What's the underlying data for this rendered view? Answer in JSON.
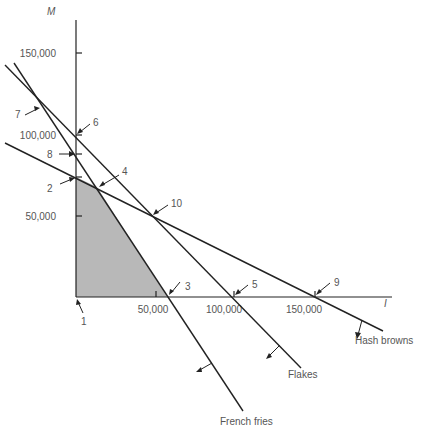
{
  "diagram": {
    "axes": {
      "y_label": "M",
      "x_label": "I",
      "y_ticks": [
        "150,000",
        "100,000",
        "50,000"
      ],
      "x_ticks": [
        "50,000",
        "100,000",
        "150,000"
      ]
    },
    "constraints": [
      {
        "name": "French fries",
        "label": "French fries"
      },
      {
        "name": "Flakes",
        "label": "Flakes"
      },
      {
        "name": "Hash browns",
        "label": "Hash browns"
      }
    ],
    "points": [
      "1",
      "2",
      "3",
      "4",
      "5",
      "6",
      "7",
      "8",
      "9",
      "10"
    ],
    "colors": {
      "line": "#222222",
      "feasible_region": "#b8b8b8",
      "text": "#555555"
    }
  }
}
